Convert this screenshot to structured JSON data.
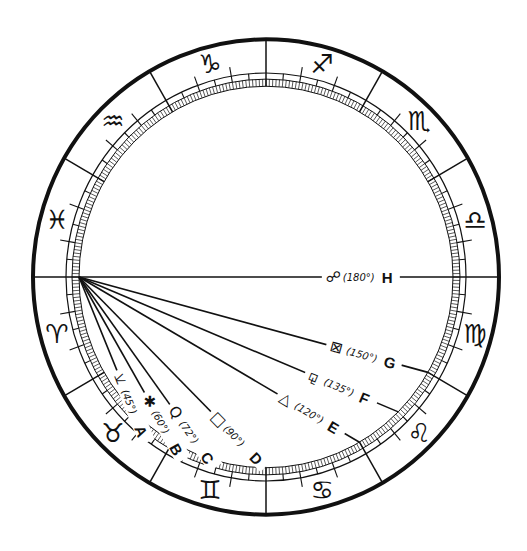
{
  "diagram": {
    "colors": {
      "ink": "#111111",
      "paper": "#ffffff"
    },
    "zodiac_signs": [
      {
        "name": "Aries",
        "glyph": "♈"
      },
      {
        "name": "Taurus",
        "glyph": "♉"
      },
      {
        "name": "Gemini",
        "glyph": "♊"
      },
      {
        "name": "Cancer",
        "glyph": "♋"
      },
      {
        "name": "Leo",
        "glyph": "♌"
      },
      {
        "name": "Virgo",
        "glyph": "♍"
      },
      {
        "name": "Libra",
        "glyph": "♎"
      },
      {
        "name": "Scorpio",
        "glyph": "♏"
      },
      {
        "name": "Sagittarius",
        "glyph": "♐"
      },
      {
        "name": "Capricorn",
        "glyph": "♑"
      },
      {
        "name": "Aquarius",
        "glyph": "♒"
      },
      {
        "name": "Pisces",
        "glyph": "♓"
      }
    ],
    "aspects": [
      {
        "letter": "A",
        "name": "semi-sextile",
        "glyph": "⚺",
        "angle_label": "(45°)",
        "angle": 45
      },
      {
        "letter": "B",
        "name": "sextile",
        "glyph": "✱",
        "angle_label": "(60°)",
        "angle": 60
      },
      {
        "letter": "C",
        "name": "quintile",
        "glyph": "Q",
        "angle_label": "(72°)",
        "angle": 72
      },
      {
        "letter": "D",
        "name": "square",
        "glyph": "□",
        "angle_label": "(90°)",
        "angle": 90
      },
      {
        "letter": "E",
        "name": "trine",
        "glyph": "△",
        "angle_label": "(120°)",
        "angle": 120
      },
      {
        "letter": "F",
        "name": "sesquiquadrate",
        "glyph": "⚼",
        "angle_label": "(135°)",
        "angle": 135
      },
      {
        "letter": "G",
        "name": "quincunx",
        "glyph": "⊠",
        "angle_label": "(150°)",
        "angle": 150
      },
      {
        "letter": "H",
        "name": "opposition",
        "glyph": "☍",
        "angle_label": "(180°)",
        "angle": 180
      }
    ]
  }
}
